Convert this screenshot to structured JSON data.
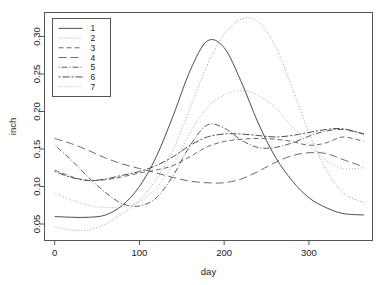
{
  "chart_data": {
    "type": "line",
    "title": "",
    "xlabel": "day",
    "ylabel": "inch",
    "xlim": [
      -12,
      375
    ],
    "ylim": [
      0.028,
      0.332
    ],
    "xticks": [
      0,
      100,
      200,
      300
    ],
    "xticklabels": [
      "0",
      "100",
      "200",
      "300"
    ],
    "yticks": [
      0.05,
      0.1,
      0.15,
      0.2,
      0.25,
      0.3
    ],
    "yticklabels": [
      "0.05",
      "0.10",
      "0.15",
      "0.20",
      "0.25",
      "0.30"
    ],
    "grid": false,
    "legend_position": "top-left",
    "legend_entries": [
      "1",
      "2",
      "3",
      "4",
      "5",
      "6",
      "7"
    ],
    "x": [
      0,
      20,
      40,
      60,
      80,
      100,
      120,
      140,
      160,
      180,
      200,
      220,
      240,
      260,
      280,
      300,
      320,
      340,
      365
    ],
    "series": [
      {
        "name": "1",
        "label": "1",
        "linestyle": "solid",
        "dasharray": "none",
        "color": "#4d4d4d",
        "values": [
          0.06,
          0.059,
          0.059,
          0.062,
          0.075,
          0.1,
          0.14,
          0.195,
          0.255,
          0.294,
          0.285,
          0.24,
          0.185,
          0.14,
          0.108,
          0.085,
          0.072,
          0.064,
          0.062
        ]
      },
      {
        "name": "2",
        "label": "2",
        "linestyle": "dotted",
        "dasharray": "1,2",
        "color": "#9e9e9e",
        "values": [
          0.046,
          0.042,
          0.042,
          0.05,
          0.064,
          0.082,
          0.11,
          0.15,
          0.205,
          0.262,
          0.303,
          0.323,
          0.32,
          0.288,
          0.232,
          0.172,
          0.123,
          0.092,
          0.078
        ]
      },
      {
        "name": "3",
        "label": "3",
        "linestyle": "dashed",
        "dasharray": "5,3",
        "color": "#6b6b6b",
        "values": [
          0.122,
          0.113,
          0.108,
          0.109,
          0.113,
          0.118,
          0.122,
          0.128,
          0.14,
          0.153,
          0.16,
          0.163,
          0.164,
          0.163,
          0.16,
          0.155,
          0.158,
          0.166,
          0.16
        ]
      },
      {
        "name": "4",
        "label": "4",
        "linestyle": "longdash",
        "dasharray": "8,4",
        "color": "#6b6b6b",
        "values": [
          0.164,
          0.157,
          0.148,
          0.138,
          0.13,
          0.124,
          0.118,
          0.112,
          0.107,
          0.105,
          0.105,
          0.11,
          0.12,
          0.132,
          0.141,
          0.145,
          0.144,
          0.136,
          0.126
        ]
      },
      {
        "name": "5",
        "label": "5",
        "linestyle": "dotdash",
        "dasharray": "1,2,6,2",
        "color": "#5c5c5c",
        "values": [
          0.155,
          0.135,
          0.112,
          0.092,
          0.077,
          0.074,
          0.085,
          0.115,
          0.155,
          0.182,
          0.178,
          0.162,
          0.152,
          0.152,
          0.158,
          0.167,
          0.174,
          0.176,
          0.17
        ]
      },
      {
        "name": "6",
        "label": "6",
        "linestyle": "twodash",
        "dasharray": "2,2,7,2",
        "color": "#4d4d4d",
        "values": [
          0.12,
          0.112,
          0.108,
          0.11,
          0.115,
          0.12,
          0.128,
          0.14,
          0.155,
          0.166,
          0.17,
          0.17,
          0.168,
          0.166,
          0.168,
          0.172,
          0.176,
          0.177,
          0.17
        ]
      },
      {
        "name": "7",
        "label": "7",
        "linestyle": "dotted-fine",
        "dasharray": "1,2",
        "color": "#a8a8a8",
        "values": [
          0.091,
          0.082,
          0.075,
          0.072,
          0.073,
          0.08,
          0.098,
          0.13,
          0.172,
          0.205,
          0.222,
          0.228,
          0.222,
          0.205,
          0.18,
          0.155,
          0.135,
          0.124,
          0.125
        ]
      }
    ]
  }
}
